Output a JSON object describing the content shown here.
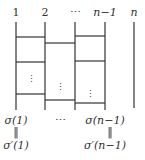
{
  "diagram": {
    "type": "amidakuji / ladder diagram",
    "top_labels": [
      "1",
      "2",
      "⋯",
      "n−1",
      "n"
    ],
    "bottom_labels": {
      "col1_top": "σ(1)",
      "col1_eq": "‖",
      "col1_bottom": "σ′(1)",
      "middle": "⋯",
      "col4_top": "σ(n−1)",
      "col4_eq": "‖",
      "col4_bottom": "σ′(n−1)"
    },
    "vertical_dots": "⋮",
    "line_color": "#333333"
  }
}
